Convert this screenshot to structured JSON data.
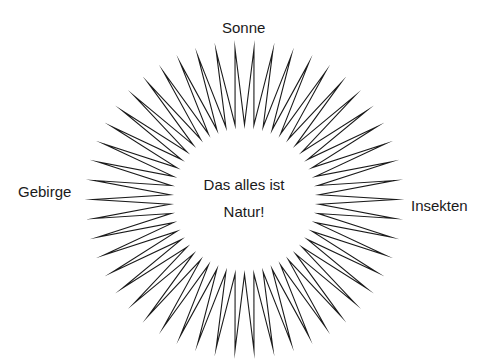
{
  "diagram": {
    "center_text": {
      "line1": "Das alles ist",
      "line2": "Natur!"
    },
    "labels": {
      "top": "Sonne",
      "left": "Gebirge",
      "right": "Insekten"
    },
    "sunburst": {
      "center_x": 244.5,
      "center_y": 199.5,
      "outer_radius": 151,
      "inner_radius": 75,
      "spike_count": 50,
      "stroke_color": "#1a1a1a",
      "stroke_width": 1.1,
      "fill_color": "#ffffff"
    }
  }
}
